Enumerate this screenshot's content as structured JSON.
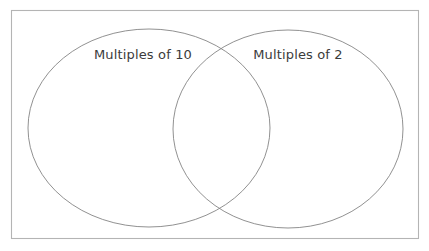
{
  "diagram": {
    "type": "venn",
    "title": "",
    "background_color": "#ffffff",
    "frame": {
      "name": "universal-set-rectangle",
      "x": 11,
      "y": 10,
      "width": 408,
      "height": 229,
      "stroke_color": "#b4b4b4"
    },
    "sets": [
      {
        "id": "left",
        "label": "Multiples of 10",
        "cx": 149,
        "cy": 128,
        "rx": 121,
        "ry": 99,
        "stroke_color": "#848484",
        "label_x": 143,
        "label_y": 59
      },
      {
        "id": "right",
        "label": "Multiples of 2",
        "cx": 288,
        "cy": 129,
        "rx": 115,
        "ry": 99,
        "stroke_color": "#848484",
        "label_x": 298,
        "label_y": 59
      }
    ],
    "intersection": {
      "name": "intersection-region",
      "label": ""
    },
    "text_color": "#3b3b3b"
  }
}
